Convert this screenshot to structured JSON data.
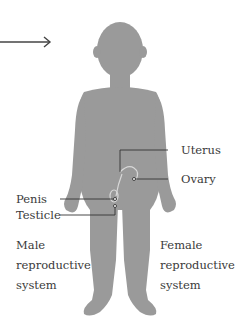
{
  "diagram": {
    "title": "",
    "labels": {
      "uterus": "Uterus",
      "ovary": "Ovary",
      "penis": "Penis",
      "testicle": "Testicle"
    },
    "groups": {
      "male": [
        "Male",
        "reproductive",
        "system"
      ],
      "female": [
        "Female",
        "reproductive",
        "system"
      ]
    },
    "colors": {
      "silhouette": "#9a9a9a",
      "lines": "#333333",
      "text": "#3a3a3a",
      "background": "#ffffff"
    }
  }
}
